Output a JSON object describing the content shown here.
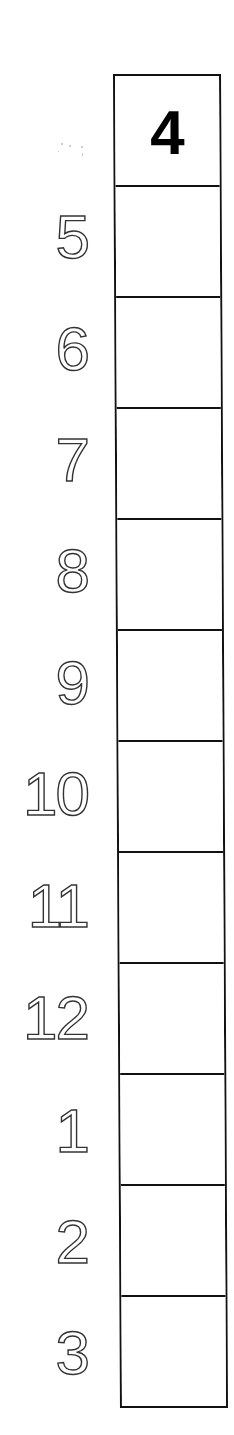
{
  "worksheet": {
    "header_number": "4",
    "colors": {
      "line": "#111111",
      "header_text": "#000000",
      "label_outline": "#333333",
      "background": "#ffffff"
    },
    "rows": [
      {
        "label": "5",
        "value": ""
      },
      {
        "label": "6",
        "value": ""
      },
      {
        "label": "7",
        "value": ""
      },
      {
        "label": "8",
        "value": ""
      },
      {
        "label": "9",
        "value": ""
      },
      {
        "label": "10",
        "value": ""
      },
      {
        "label": "11",
        "value": ""
      },
      {
        "label": "12",
        "value": ""
      },
      {
        "label": "1",
        "value": ""
      },
      {
        "label": "2",
        "value": ""
      },
      {
        "label": "3",
        "value": ""
      }
    ]
  }
}
